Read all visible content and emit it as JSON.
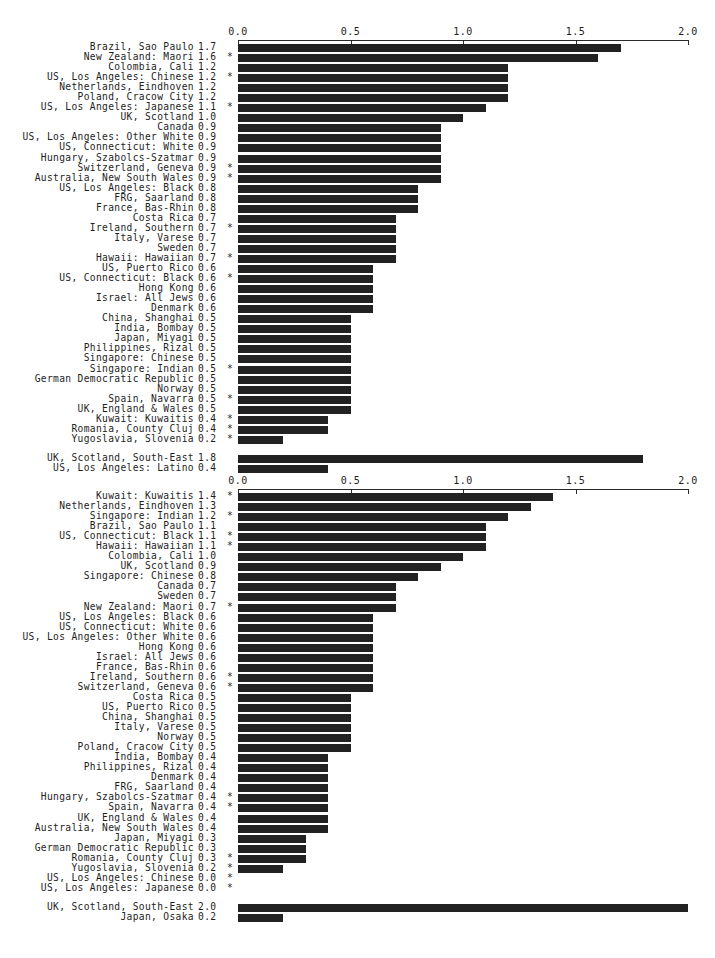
{
  "figure": {
    "background_color": "#ffffff",
    "bar_color": "#222222",
    "axis_color": "#2a2a2a",
    "significance_marker": "*"
  },
  "chart_data": [
    {
      "id": "chart-1",
      "type": "bar",
      "orientation": "horizontal",
      "title": "",
      "xlabel": "",
      "ylabel": "",
      "xlim": [
        0.0,
        2.0
      ],
      "xticks": [
        0.0,
        0.5,
        1.0,
        1.5,
        2.0
      ],
      "xtick_labels": [
        "0.0",
        "0.5",
        "1.0",
        "1.5",
        "2.0"
      ],
      "axis_position": "top",
      "grid": false,
      "legend": "none",
      "value_precision": 1,
      "categories": [
        "Brazil, Sao Paulo",
        "New Zealand: Maori",
        "Colombia, Cali",
        "US, Los Angeles: Chinese",
        "Netherlands, Eindhoven",
        "Poland, Cracow City",
        "US, Los Angeles: Japanese",
        "UK, Scotland",
        "Canada",
        "US, Los Angeles: Other White",
        "US, Connecticut: White",
        "Hungary, Szabolcs-Szatmar",
        "Switzerland, Geneva",
        "Australia, New South Wales",
        "US, Los Angeles: Black",
        "FRG, Saarland",
        "France, Bas-Rhin",
        "Costa Rica",
        "Ireland, Southern",
        "Italy, Varese",
        "Sweden",
        "Hawaii: Hawaiian",
        "US, Puerto Rico",
        "US, Connecticut: Black",
        "Hong Kong",
        "Israel: All Jews",
        "Denmark",
        "China, Shanghai",
        "India, Bombay",
        "Japan, Miyagi",
        "Philippines, Rizal",
        "Singapore: Chinese",
        "Singapore: Indian",
        "German Democratic Republic",
        "Norway",
        "Spain, Navarra",
        "UK, England & Wales",
        "Kuwait: Kuwaitis",
        "Romania, County Cluj",
        "Yugoslavia, Slovenia"
      ],
      "values": [
        1.7,
        1.6,
        1.2,
        1.2,
        1.2,
        1.2,
        1.1,
        1.0,
        0.9,
        0.9,
        0.9,
        0.9,
        0.9,
        0.9,
        0.8,
        0.8,
        0.8,
        0.7,
        0.7,
        0.7,
        0.7,
        0.7,
        0.6,
        0.6,
        0.6,
        0.6,
        0.6,
        0.5,
        0.5,
        0.5,
        0.5,
        0.5,
        0.5,
        0.5,
        0.5,
        0.5,
        0.5,
        0.4,
        0.4,
        0.2
      ],
      "starred": [
        false,
        true,
        false,
        true,
        false,
        false,
        true,
        false,
        false,
        false,
        false,
        false,
        true,
        true,
        false,
        false,
        false,
        false,
        true,
        false,
        false,
        true,
        false,
        true,
        false,
        false,
        false,
        false,
        false,
        false,
        false,
        false,
        true,
        false,
        false,
        true,
        false,
        true,
        true,
        true
      ],
      "extra_group": {
        "categories": [
          "UK, Scotland, South-East",
          "US, Los Angeles: Latino"
        ],
        "values": [
          1.8,
          0.4
        ],
        "starred": [
          false,
          false
        ]
      }
    },
    {
      "id": "chart-2",
      "type": "bar",
      "orientation": "horizontal",
      "title": "",
      "xlabel": "",
      "ylabel": "",
      "xlim": [
        0.0,
        2.0
      ],
      "xticks": [
        0.0,
        0.5,
        1.0,
        1.5,
        2.0
      ],
      "xtick_labels": [
        "0.0",
        "0.5",
        "1.0",
        "1.5",
        "2.0"
      ],
      "axis_position": "top",
      "grid": false,
      "legend": "none",
      "value_precision": 1,
      "categories": [
        "Kuwait: Kuwaitis",
        "Netherlands, Eindhoven",
        "Singapore: Indian",
        "Brazil, Sao Paulo",
        "US, Connecticut: Black",
        "Hawaii: Hawaiian",
        "Colombia, Cali",
        "UK, Scotland",
        "Singapore: Chinese",
        "Canada",
        "Sweden",
        "New Zealand: Maori",
        "US, Los Angeles: Black",
        "US, Connecticut: White",
        "US, Los Angeles: Other White",
        "Hong Kong",
        "Israel: All Jews",
        "France, Bas-Rhin",
        "Ireland, Southern",
        "Switzerland, Geneva",
        "Costa Rica",
        "US, Puerto Rico",
        "China, Shanghai",
        "Italy, Varese",
        "Norway",
        "Poland, Cracow City",
        "India, Bombay",
        "Philippines, Rizal",
        "Denmark",
        "FRG, Saarland",
        "Hungary, Szabolcs-Szatmar",
        "Spain, Navarra",
        "UK, England & Wales",
        "Australia, New South Wales",
        "Japan, Miyagi",
        "German Democratic Republic",
        "Romania, County Cluj",
        "Yugoslavia, Slovenia",
        "US, Los Angeles: Chinese",
        "US, Los Angeles: Japanese"
      ],
      "values": [
        1.4,
        1.3,
        1.2,
        1.1,
        1.1,
        1.1,
        1.0,
        0.9,
        0.8,
        0.7,
        0.7,
        0.7,
        0.6,
        0.6,
        0.6,
        0.6,
        0.6,
        0.6,
        0.6,
        0.6,
        0.5,
        0.5,
        0.5,
        0.5,
        0.5,
        0.5,
        0.4,
        0.4,
        0.4,
        0.4,
        0.4,
        0.4,
        0.4,
        0.4,
        0.3,
        0.3,
        0.3,
        0.2,
        0.0,
        0.0
      ],
      "starred": [
        true,
        false,
        true,
        false,
        true,
        true,
        false,
        false,
        false,
        false,
        false,
        true,
        false,
        false,
        false,
        false,
        false,
        false,
        true,
        true,
        false,
        false,
        false,
        false,
        false,
        false,
        false,
        false,
        false,
        false,
        true,
        true,
        false,
        false,
        false,
        false,
        true,
        true,
        true,
        true
      ],
      "extra_group": {
        "categories": [
          "UK, Scotland, South-East",
          "Japan, Osaka"
        ],
        "values": [
          2.0,
          0.2
        ],
        "starred": [
          false,
          false
        ]
      }
    }
  ]
}
